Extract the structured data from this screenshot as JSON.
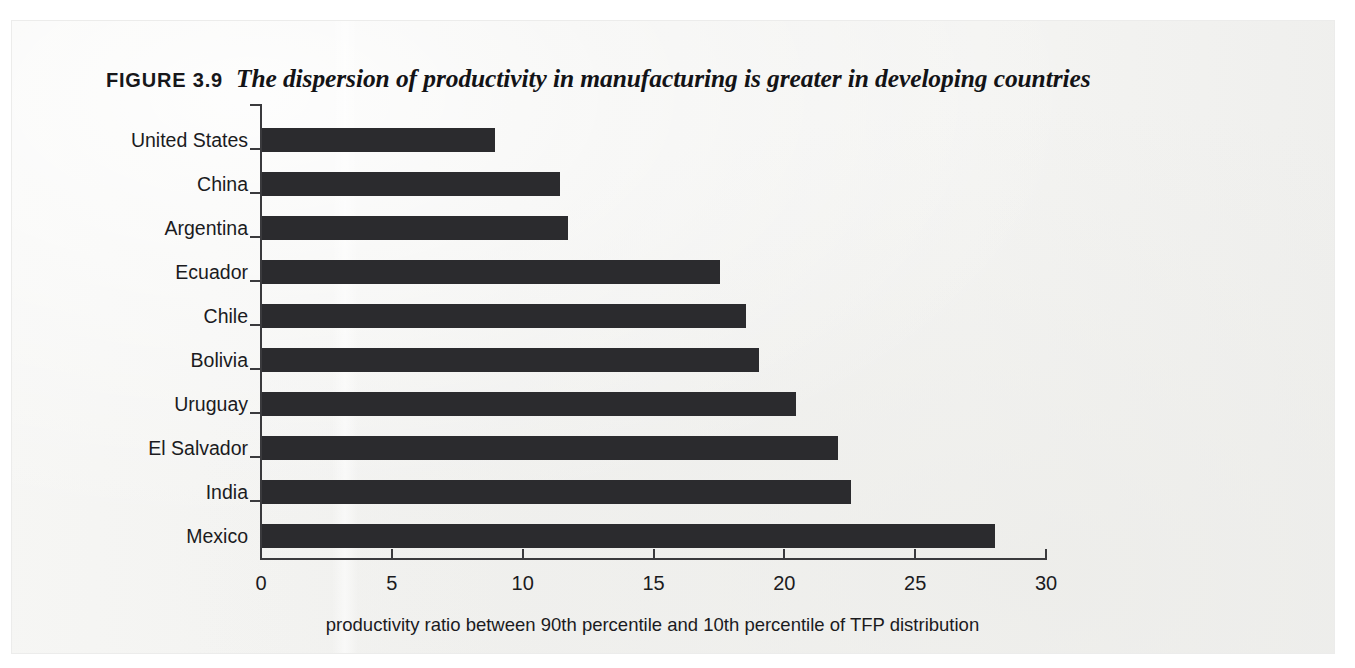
{
  "figure": {
    "label": "FIGURE 3.9",
    "title": "The dispersion of productivity in manufacturing is greater in developing countries"
  },
  "colors": {
    "bar": "#2b2b2e",
    "axis": "#3a3a3d",
    "text": "#1b1b1e",
    "page": "#f3f3f1"
  },
  "chart_data": {
    "type": "bar",
    "orientation": "horizontal",
    "title": "The dispersion of productivity in manufacturing is greater in developing countries",
    "categories": [
      "United States",
      "China",
      "Argentina",
      "Ecuador",
      "Chile",
      "Bolivia",
      "Uruguay",
      "El Salvador",
      "India",
      "Mexico"
    ],
    "values": [
      8.9,
      11.4,
      11.7,
      17.5,
      18.5,
      19.0,
      20.4,
      22.0,
      22.5,
      28.0
    ],
    "series": [
      {
        "name": "productivity ratio between 90th percentile and 10th percentile of TFP distribution",
        "values": [
          8.9,
          11.4,
          11.7,
          17.5,
          18.5,
          19.0,
          20.4,
          22.0,
          22.5,
          28.0
        ]
      }
    ],
    "xlabel": "productivity ratio between 90th percentile and 10th percentile of TFP distribution",
    "ylabel": "",
    "xlim": [
      0,
      30
    ],
    "xticks": [
      0,
      5,
      10,
      15,
      20,
      25,
      30
    ],
    "xtick_labels": [
      "0",
      "5",
      "10",
      "15",
      "20",
      "25",
      "30"
    ],
    "grid": false,
    "legend": false
  }
}
